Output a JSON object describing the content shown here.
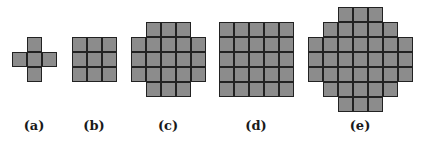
{
  "colors": {
    "cell_fill": "#8c8c8c",
    "cell_border": "#222222",
    "background": "#ffffff"
  },
  "cell_size": 15,
  "figures": [
    {
      "label": "(a)",
      "origin": [
        12,
        37
      ],
      "label_x": 34,
      "row_spans": [
        [
          1,
          1
        ],
        [
          0,
          2
        ],
        [
          1,
          1
        ]
      ]
    },
    {
      "label": "(b)",
      "origin": [
        72,
        37
      ],
      "label_x": 94,
      "row_spans": [
        [
          0,
          2
        ],
        [
          0,
          2
        ],
        [
          0,
          2
        ]
      ]
    },
    {
      "label": "(c)",
      "origin": [
        131,
        22
      ],
      "label_x": 168,
      "row_spans": [
        [
          1,
          3
        ],
        [
          0,
          4
        ],
        [
          0,
          4
        ],
        [
          0,
          4
        ],
        [
          1,
          3
        ]
      ]
    },
    {
      "label": "(d)",
      "origin": [
        219,
        22
      ],
      "label_x": 256,
      "row_spans": [
        [
          0,
          4
        ],
        [
          0,
          4
        ],
        [
          0,
          4
        ],
        [
          0,
          4
        ],
        [
          0,
          4
        ]
      ]
    },
    {
      "label": "(e)",
      "origin": [
        308,
        7
      ],
      "label_x": 360,
      "row_spans": [
        [
          2,
          4
        ],
        [
          1,
          5
        ],
        [
          0,
          6
        ],
        [
          0,
          6
        ],
        [
          0,
          6
        ],
        [
          1,
          5
        ],
        [
          2,
          4
        ]
      ]
    }
  ]
}
